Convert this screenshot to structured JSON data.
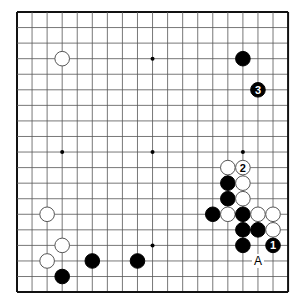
{
  "board": {
    "size": 19,
    "origin_x": 17,
    "origin_y": 12,
    "spacing_x": 15.06,
    "spacing_y": 15.56,
    "stone_radius": 7.3,
    "line_color": "#555555",
    "border_color": "#111111",
    "star_points": [
      [
        3,
        9
      ],
      [
        9,
        3
      ],
      [
        9,
        9
      ],
      [
        15,
        9
      ],
      [
        9,
        15
      ]
    ]
  },
  "stones": [
    {
      "color": "white",
      "col": 3,
      "row": 3,
      "label": ""
    },
    {
      "color": "black",
      "col": 15,
      "row": 3,
      "label": ""
    },
    {
      "color": "black",
      "col": 16,
      "row": 5,
      "label": "3"
    },
    {
      "color": "white",
      "col": 14,
      "row": 10,
      "label": ""
    },
    {
      "color": "white",
      "col": 15,
      "row": 10,
      "label": "2"
    },
    {
      "color": "black",
      "col": 14,
      "row": 11,
      "label": ""
    },
    {
      "color": "white",
      "col": 15,
      "row": 11,
      "label": ""
    },
    {
      "color": "black",
      "col": 14,
      "row": 12,
      "label": ""
    },
    {
      "color": "white",
      "col": 15,
      "row": 12,
      "label": ""
    },
    {
      "color": "black",
      "col": 13,
      "row": 13,
      "label": ""
    },
    {
      "color": "white",
      "col": 14,
      "row": 13,
      "label": ""
    },
    {
      "color": "black",
      "col": 15,
      "row": 13,
      "label": ""
    },
    {
      "color": "white",
      "col": 16,
      "row": 13,
      "label": ""
    },
    {
      "color": "white",
      "col": 17,
      "row": 13,
      "label": ""
    },
    {
      "color": "black",
      "col": 15,
      "row": 14,
      "label": ""
    },
    {
      "color": "black",
      "col": 16,
      "row": 14,
      "label": ""
    },
    {
      "color": "white",
      "col": 17,
      "row": 14,
      "label": ""
    },
    {
      "color": "black",
      "col": 15,
      "row": 15,
      "label": ""
    },
    {
      "color": "black",
      "col": 17,
      "row": 15,
      "label": "1"
    },
    {
      "color": "white",
      "col": 2,
      "row": 13,
      "label": ""
    },
    {
      "color": "white",
      "col": 3,
      "row": 15,
      "label": ""
    },
    {
      "color": "white",
      "col": 2,
      "row": 16,
      "label": ""
    },
    {
      "color": "black",
      "col": 5,
      "row": 16,
      "label": ""
    },
    {
      "color": "black",
      "col": 8,
      "row": 16,
      "label": ""
    },
    {
      "color": "black",
      "col": 3,
      "row": 17,
      "label": ""
    }
  ],
  "markers": [
    {
      "col": 16,
      "row": 16,
      "label": "A"
    }
  ]
}
